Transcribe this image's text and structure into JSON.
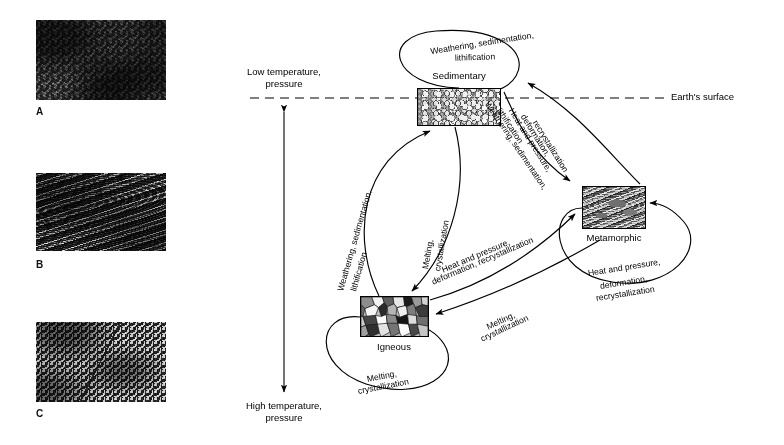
{
  "figure": {
    "line_color": "#000000",
    "background": "#ffffff"
  },
  "photos": [
    {
      "label": "A",
      "name": "photo-a",
      "rock_type": "Sedimentary",
      "x": 36,
      "y": 20,
      "width": 130,
      "height": 80,
      "label_x": 36,
      "label_y": 108
    },
    {
      "label": "B",
      "name": "photo-b",
      "rock_type": "Metamorphic",
      "x": 36,
      "y": 173,
      "width": 130,
      "height": 78,
      "label_x": 36,
      "label_y": 261
    },
    {
      "label": "C",
      "name": "photo-c",
      "rock_type": "Igneous",
      "x": 36,
      "y": 322,
      "width": 130,
      "height": 80,
      "label_x": 36,
      "label_y": 410
    }
  ],
  "axis": {
    "top_label": "Low temperature,\npressure",
    "bottom_label": "High temperature,\npressure",
    "arrow_x": 284,
    "arrow_top_y": 110,
    "arrow_bottom_y": 394,
    "top_label_x": 284,
    "top_label_y": 74,
    "bottom_label_x": 284,
    "bottom_label_y": 404
  },
  "earth_surface": {
    "label": "Earth's surface",
    "label_x": 672,
    "label_y": 92,
    "line_y": 98,
    "line_x1": 250,
    "line_x2": 664,
    "dash": "9 6"
  },
  "nodes": [
    {
      "id": "sedimentary",
      "caption": "Sedimentary",
      "x": 417,
      "y": 88,
      "width": 84,
      "height": 38,
      "caption_x": 459,
      "caption_y": 76
    },
    {
      "id": "metamorphic",
      "caption": "Metamorphic",
      "x": 582,
      "y": 186,
      "width": 64,
      "height": 43,
      "caption_x": 614,
      "caption_y": 238
    },
    {
      "id": "igneous",
      "caption": "Igneous",
      "x": 360,
      "y": 296,
      "width": 69,
      "height": 41,
      "caption_x": 394,
      "caption_y": 347
    }
  ],
  "processes": {
    "weathering": "Weathering, sedimentation,\nlithification",
    "heat_pressure": "Heat and pressure,\ndeformation,\nrecrystallization",
    "melting": "Melting,\ncrystallization"
  },
  "edges": [
    {
      "id": "sed-self-loop",
      "from": "sedimentary",
      "to": "sedimentary",
      "label": "Weathering, sedimentation,\nlithification",
      "label_lines": [
        "Weathering, sedimentation,",
        "lithification"
      ],
      "note": "self loop arcing above the Sedimentary box"
    },
    {
      "id": "meta-to-sed",
      "from": "metamorphic",
      "to": "sedimentary",
      "label": "Weathering, sedimentation,\nlithification",
      "label_lines": [
        "Weathering, sedimentation,",
        "lithification"
      ],
      "note": "outer right curve, arrowhead at Sedimentary"
    },
    {
      "id": "sed-to-meta",
      "from": "sedimentary",
      "to": "metamorphic",
      "label": "Heat and pressure,\ndeformation,\nrecrystallization",
      "label_lines": [
        "Heat and pressure,",
        "deformation,",
        "recrystallization"
      ],
      "note": "inner right curve, arrowhead at Metamorphic"
    },
    {
      "id": "ign-to-sed",
      "from": "igneous",
      "to": "sedimentary",
      "label": "Weathering, sedimentation,\nlithification",
      "label_lines": [
        "Weathering, sedimentation,",
        "lithification"
      ],
      "note": "left vertical curve, arrowhead at Sedimentary"
    },
    {
      "id": "sed-to-ign",
      "from": "sedimentary",
      "to": "igneous",
      "label": "Melting,\ncrystallization",
      "label_lines": [
        "Melting,",
        "crystallization"
      ],
      "note": "right vertical curve, arrowhead at Igneous"
    },
    {
      "id": "ign-to-meta",
      "from": "igneous",
      "to": "metamorphic",
      "label": "Heat and pressure,\ndeformation, recrystallization",
      "label_lines": [
        "Heat and pressure,",
        "deformation, recrystallization"
      ],
      "note": "diagonal, arrowhead at Metamorphic"
    },
    {
      "id": "meta-to-ign",
      "from": "metamorphic",
      "to": "igneous",
      "label": "Melting,\ncrystallization",
      "label_lines": [
        "Melting,",
        "crystallization"
      ],
      "note": "diagonal, arrowhead at Igneous"
    },
    {
      "id": "meta-self-loop",
      "from": "metamorphic",
      "to": "metamorphic",
      "label": "Heat and pressure,\ndeformation,\nrecrystallization",
      "label_lines": [
        "Heat and pressure,",
        "deformation,",
        "recrystallization"
      ],
      "note": "self loop below/right of the Metamorphic box"
    },
    {
      "id": "ign-self-loop",
      "from": "igneous",
      "to": "igneous",
      "label": "Melting,\ncrystallization",
      "label_lines": [
        "Melting,",
        "crystallization"
      ],
      "note": "self loop below/left of the Igneous box"
    }
  ]
}
